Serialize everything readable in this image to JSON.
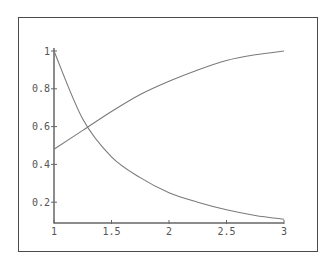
{
  "chart_data": {
    "type": "line",
    "title": "",
    "xlabel": "",
    "ylabel": "",
    "xlim": [
      1,
      3
    ],
    "ylim": [
      0.09,
      1.0
    ],
    "grid": false,
    "legend": null,
    "x_ticks": [
      {
        "value": 1,
        "label": "1"
      },
      {
        "value": 1.5,
        "label": "1.5"
      },
      {
        "value": 2,
        "label": "2"
      },
      {
        "value": 2.5,
        "label": "2.5"
      },
      {
        "value": 3,
        "label": "3"
      }
    ],
    "y_ticks": [
      {
        "value": 0.2,
        "label": "0.2"
      },
      {
        "value": 0.4,
        "label": "0.4"
      },
      {
        "value": 0.6,
        "label": "0.6"
      },
      {
        "value": 0.8,
        "label": "0.8"
      },
      {
        "value": 1.0,
        "label": "1"
      }
    ],
    "x": [
      1.0,
      1.25,
      1.5,
      1.75,
      2.0,
      2.25,
      2.5,
      2.75,
      3.0
    ],
    "series": [
      {
        "name": "increasing curve",
        "values": [
          0.48,
          0.58,
          0.68,
          0.77,
          0.84,
          0.9,
          0.95,
          0.98,
          1.0
        ]
      },
      {
        "name": "decreasing curve",
        "values": [
          1.0,
          0.64,
          0.44,
          0.33,
          0.25,
          0.2,
          0.16,
          0.13,
          0.11
        ]
      }
    ]
  },
  "colors": {
    "frame": "#4a4a4a",
    "axis": "#666666",
    "curve": "#7a7a7a",
    "text": "#555555"
  }
}
